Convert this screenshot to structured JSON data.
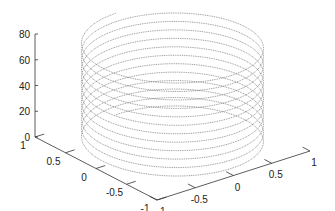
{
  "chart_data": {
    "type": "line",
    "subtype": "3d-line",
    "title": "",
    "xlabel": "",
    "ylabel": "",
    "zlabel": "",
    "xlim": [
      -1,
      1
    ],
    "ylim": [
      -1,
      1
    ],
    "zlim": [
      0,
      80
    ],
    "x_ticks": [
      "-1",
      "-0.5",
      "0",
      "0.5",
      "1"
    ],
    "y_ticks": [
      "1",
      "0.5",
      "0",
      "-0.5",
      "-1"
    ],
    "z_ticks": [
      "0",
      "20",
      "40",
      "60",
      "80"
    ],
    "series": [
      {
        "name": "helix",
        "x_expr": "sin(t)",
        "y_expr": "cos(t)",
        "z_expr": "t",
        "t_range": [
          0,
          75.4
        ],
        "turns": 12,
        "color": "#555555",
        "line_style": "dotted"
      }
    ],
    "grid": false,
    "legend": null,
    "view": "default 3d (azimuth -37.5, elevation 30)"
  },
  "colors": {
    "background": "#ffffff",
    "axis": "#333333",
    "line": "#555555",
    "text": "#222222"
  }
}
